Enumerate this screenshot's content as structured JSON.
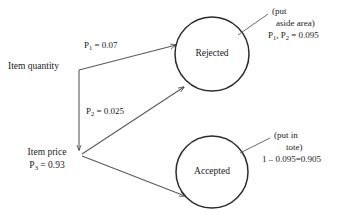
{
  "diagram": {
    "type": "flow-probability-diagram",
    "nodes": [
      {
        "id": "rejected",
        "label": "Rejected",
        "shape": "circle",
        "cx": 212,
        "cy": 54,
        "r": 37
      },
      {
        "id": "accepted",
        "label": "Accepted",
        "shape": "circle",
        "cx": 212,
        "cy": 172,
        "r": 36
      }
    ],
    "sources": [
      {
        "id": "item-quantity",
        "label": "Item quantity",
        "value": "",
        "x": 8,
        "y": 60
      },
      {
        "id": "item-price",
        "label": "Item price",
        "value_prefix": "P",
        "value_sub": "3",
        "value_suffix": " = 0.93",
        "x": 20,
        "y": 147
      }
    ],
    "edges": [
      {
        "id": "quantity-to-rejected",
        "from": "item-quantity",
        "to": "rejected",
        "label_prefix": "P",
        "label_sub": "1",
        "label_suffix": " = 0.07"
      },
      {
        "id": "price-to-rejected",
        "from": "item-price",
        "to": "rejected",
        "label_prefix": "P",
        "label_sub": "2",
        "label_suffix": " = 0.025"
      },
      {
        "id": "price-to-accepted",
        "from": "item-price",
        "to": "accepted",
        "label": ""
      }
    ],
    "annotations": [
      {
        "id": "rejected-annotation",
        "target": "rejected",
        "line1": "(put",
        "line2": "aside area)",
        "line3_prefix": "P",
        "line3_sub1": "1",
        "line3_mid": ", P",
        "line3_sub2": "2",
        "line3_suffix": " = 0.095"
      },
      {
        "id": "accepted-annotation",
        "target": "accepted",
        "line1": "(put in",
        "line2": "tote)",
        "line3": "1 – 0.095=0.905"
      }
    ],
    "colors": {
      "stroke": "#2b2b2b",
      "text": "#1a1a1a",
      "background": "#ffffff"
    }
  }
}
